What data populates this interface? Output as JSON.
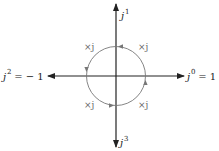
{
  "diagram": {
    "title": "",
    "axes": {
      "up": {
        "base": "j",
        "exponent": "1",
        "suffix": ""
      },
      "right": {
        "base": "j",
        "exponent": "0",
        "suffix": " = 1"
      },
      "left": {
        "base": "j",
        "exponent": "2",
        "suffix": " = − 1"
      },
      "down": {
        "base": "j",
        "exponent": "3",
        "suffix": ""
      }
    },
    "circle_labels": [
      {
        "position": "top-left",
        "text": "×j"
      },
      {
        "position": "top-right",
        "text": "×j"
      },
      {
        "position": "bottom-left",
        "text": "×j"
      },
      {
        "position": "bottom-right",
        "text": "×j"
      }
    ],
    "rotation_direction": "counterclockwise",
    "colors": {
      "axis": "#222222",
      "circle": "#777777",
      "labels": "#222222",
      "multiplier_labels": "#666666"
    }
  }
}
